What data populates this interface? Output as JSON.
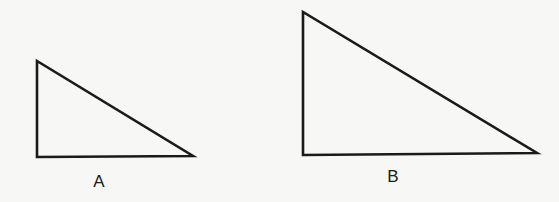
{
  "diagram": {
    "background": "#f7f7f5",
    "stroke_color": "#1a1a1a",
    "stroke_width": 2.6,
    "triangles": [
      {
        "id": "A",
        "label": "A",
        "vertices": [
          [
            37,
            61
          ],
          [
            37,
            157
          ],
          [
            193,
            156
          ]
        ],
        "label_pos": [
          99,
          181
        ]
      },
      {
        "id": "B",
        "label": "B",
        "vertices": [
          [
            303,
            12
          ],
          [
            303,
            155
          ],
          [
            537,
            153
          ]
        ],
        "label_pos": [
          393,
          176
        ]
      }
    ]
  }
}
